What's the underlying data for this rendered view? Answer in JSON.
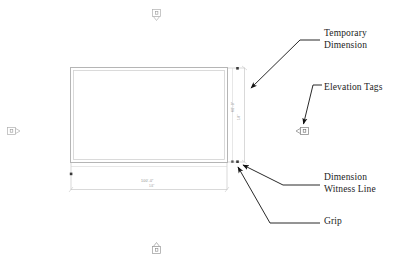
{
  "canvas": {
    "width": 407,
    "height": 269,
    "background": "#ffffff"
  },
  "colors": {
    "wall_line": "#b7b7b7",
    "wall_line_inner": "#cfcfcf",
    "dimension_line": "#c8c8c8",
    "witness_line": "#c8c8c8",
    "grip": "#3a3a3a",
    "annotation_text": "#1c1c1c",
    "leader_line": "#000000",
    "elevation_tag": "#b0b0b0",
    "dimension_text": "#8a8a8a"
  },
  "annotations": [
    {
      "id": "temporary-dimension",
      "label": "Temporary\nDimension",
      "points_to": "temporary-dimension-line"
    },
    {
      "id": "elevation-tags",
      "label": "Elevation Tags",
      "points_to": "elevation-tag-right"
    },
    {
      "id": "dimension-witness-line",
      "label": "Dimension\nWitness Line",
      "points_to": "witness-line-bottom-right"
    },
    {
      "id": "grip",
      "label": "Grip",
      "points_to": "grip-bottom-right"
    }
  ],
  "dimensions": {
    "horizontal": {
      "value": "100'-0\"",
      "sub": "1/4\"",
      "orientation": "horizontal"
    },
    "vertical": {
      "value": "60'-0\"",
      "sub": "1/4\"",
      "orientation": "vertical"
    }
  },
  "elevation_tags": [
    {
      "id": "elevation-tag-top",
      "direction": "down",
      "x": 157,
      "y": 12
    },
    {
      "id": "elevation-tag-left",
      "direction": "right",
      "x": 11,
      "y": 130
    },
    {
      "id": "elevation-tag-right",
      "direction": "left",
      "x": 299,
      "y": 130
    },
    {
      "id": "elevation-tag-bottom",
      "direction": "up",
      "x": 157,
      "y": 246
    }
  ],
  "grips": [
    {
      "id": "grip-top-right",
      "x": 239,
      "y": 70
    },
    {
      "id": "grip-bottom-right",
      "x": 239,
      "y": 160
    },
    {
      "id": "grip-bottom-left",
      "x": 71,
      "y": 174
    },
    {
      "id": "grip-mid-right",
      "x": 233,
      "y": 160
    }
  ],
  "building": {
    "name": "floor-plan-rectangle",
    "x": 71,
    "y": 68,
    "width": 156,
    "height": 94
  }
}
